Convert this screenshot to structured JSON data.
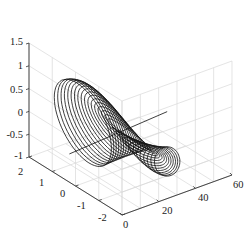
{
  "chart_data": {
    "type": "line3d",
    "title": "",
    "xlabel": "",
    "ylabel": "",
    "zlabel": "",
    "xlim": [
      0,
      60
    ],
    "ylim": [
      -2,
      2
    ],
    "zlim": [
      -1,
      1.5
    ],
    "x_ticks": [
      "0",
      "20",
      "40",
      "60"
    ],
    "y_ticks": [
      "2",
      "1",
      "0",
      "-1",
      "-2"
    ],
    "z_ticks": [
      "1.5",
      "1",
      "0.5",
      "0",
      "-0.5",
      "-1"
    ],
    "grid": true,
    "legend": null,
    "series": [
      {
        "name": "curve-family",
        "loops": 30,
        "color": "#111111",
        "z_max": 1.3,
        "z_min": -1.0,
        "x_range": [
          0,
          50
        ]
      }
    ]
  }
}
